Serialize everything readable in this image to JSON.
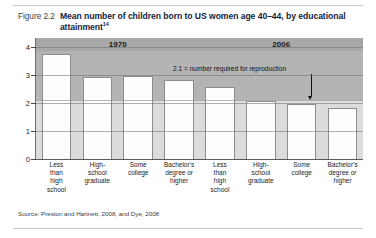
{
  "figure": {
    "number": "Figure 2.2",
    "title": "Mean number of children born to US women age 40–44, by educational attainment",
    "title_superscript": "14",
    "source": "Source: Preston and Hartnett, 2008, and Dye, 2008"
  },
  "annotation": {
    "text": "2.1 = number required for reproduction",
    "value": 2.1
  },
  "chart_data": {
    "type": "bar",
    "title": "Mean number of children born to US women age 40–44, by educational attainment",
    "xlabel": "",
    "ylabel": "",
    "ylim": [
      0,
      4
    ],
    "yticks": [
      "0",
      "1",
      "2",
      "3",
      "4"
    ],
    "grid": true,
    "legend": "none",
    "groups": [
      {
        "label": "1970",
        "categories": [
          "Less than high school",
          "High-school graduate",
          "Some college",
          "Bachelor's degree or higher"
        ],
        "values": [
          3.8,
          2.95,
          3.0,
          2.85
        ]
      },
      {
        "label": "2006",
        "categories": [
          "Less than high school",
          "High-school graduate",
          "Some college",
          "Bachelor's degree or higher"
        ],
        "values": [
          2.6,
          2.1,
          2.0,
          1.85
        ]
      }
    ],
    "reference_line": {
      "value": 2.1,
      "label": "2.1 = number required for reproduction"
    }
  },
  "xlabels": [
    {
      "lines": [
        "Less",
        "than",
        "high",
        "school"
      ]
    },
    {
      "lines": [
        "High-",
        "school",
        "graduate"
      ]
    },
    {
      "lines": [
        "Some",
        "college"
      ]
    },
    {
      "lines": [
        "Bachelor's",
        "degree or",
        "higher"
      ]
    },
    {
      "lines": [
        "Less",
        "than",
        "high",
        "school"
      ]
    },
    {
      "lines": [
        "High-",
        "school",
        "graduate"
      ]
    },
    {
      "lines": [
        "Some",
        "college"
      ]
    },
    {
      "lines": [
        "Bachelor's",
        "degree or",
        "higher"
      ]
    }
  ],
  "colors": {
    "plot_background": "#e9e9e9",
    "upper_shade": "#b4b4b4",
    "band_low": "#dcdcdc",
    "group_band": "#a8a8a8",
    "bar_fill": "#fdfdfd",
    "bar_border": "#8d8d8d",
    "title": "#13233c"
  }
}
